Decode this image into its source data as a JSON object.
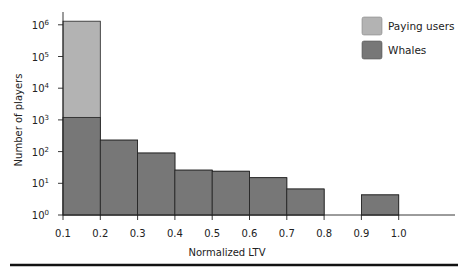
{
  "chart_data": {
    "type": "bar",
    "subtype": "stacked-overlay-histogram",
    "title": "",
    "xlabel": "Normalized LTV",
    "ylabel": "Number of players",
    "yscale": "log",
    "ylim": [
      1,
      1000000
    ],
    "x_ticks": [
      "0.1",
      "0.2",
      "0.3",
      "0.4",
      "0.5",
      "0.6",
      "0.7",
      "0.8",
      "0.9",
      "1.0"
    ],
    "y_ticks": [
      "10^0",
      "10^1",
      "10^2",
      "10^3",
      "10^4",
      "10^5",
      "10^6"
    ],
    "bins": [
      {
        "from": 0.1,
        "to": 0.2
      },
      {
        "from": 0.2,
        "to": 0.3
      },
      {
        "from": 0.3,
        "to": 0.4
      },
      {
        "from": 0.4,
        "to": 0.5
      },
      {
        "from": 0.5,
        "to": 0.6
      },
      {
        "from": 0.6,
        "to": 0.7
      },
      {
        "from": 0.7,
        "to": 0.8
      },
      {
        "from": 0.8,
        "to": 0.9
      },
      {
        "from": 0.9,
        "to": 1.0
      }
    ],
    "series": [
      {
        "name": "Paying users",
        "color": "#b3b3b3",
        "values": [
          1300000,
          230,
          90,
          26,
          24,
          15,
          6.6,
          0,
          4.3
        ]
      },
      {
        "name": "Whales",
        "color": "#777777",
        "values": [
          1200,
          230,
          90,
          26,
          24,
          15,
          6.6,
          0,
          4.3
        ]
      }
    ],
    "grid": false,
    "legend_position": "top-right"
  },
  "legend": {
    "items": [
      {
        "label": "Paying users",
        "color": "#b3b3b3"
      },
      {
        "label": "Whales",
        "color": "#777777"
      }
    ]
  },
  "axes": {
    "xlabel": "Normalized LTV",
    "ylabel": "Number of players",
    "x_ticks": [
      "0.1",
      "0.2",
      "0.3",
      "0.4",
      "0.5",
      "0.6",
      "0.7",
      "0.8",
      "0.9",
      "1.0"
    ],
    "y_ticks": [
      {
        "base": "10",
        "exp": "0"
      },
      {
        "base": "10",
        "exp": "1"
      },
      {
        "base": "10",
        "exp": "2"
      },
      {
        "base": "10",
        "exp": "3"
      },
      {
        "base": "10",
        "exp": "4"
      },
      {
        "base": "10",
        "exp": "5"
      },
      {
        "base": "10",
        "exp": "6"
      }
    ]
  }
}
